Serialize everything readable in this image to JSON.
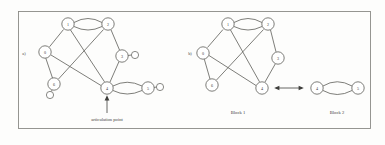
{
  "figure": {
    "panels": [
      {
        "id": "a",
        "label": "a)"
      },
      {
        "id": "b",
        "label": "b)"
      }
    ],
    "annotations": {
      "articulation_point": "articulation point",
      "block_1": "Block 1",
      "block_2": "Block 2"
    },
    "colors": {
      "background": "#fdfdfc",
      "frame_stroke": "#8b8b86",
      "node_stroke": "#5d5d58",
      "node_fill": "#ffffff",
      "edge_stroke": "#5d5d58",
      "text": "#3f3f3c"
    }
  },
  "graph_a": {
    "description": "Undirected graph with an articulation point at vertex 4",
    "nodes": [
      {
        "id": "1",
        "label": "1",
        "cx": 68,
        "cy": 24,
        "r": 6.2
      },
      {
        "id": "2",
        "label": "2",
        "cx": 108,
        "cy": 24,
        "r": 6.2
      },
      {
        "id": "3",
        "label": "3",
        "cx": 122,
        "cy": 56,
        "r": 6.2
      },
      {
        "id": "4",
        "label": "4",
        "cx": 107,
        "cy": 88,
        "r": 6.2
      },
      {
        "id": "5",
        "label": "5",
        "cx": 148,
        "cy": 88,
        "r": 6.2
      },
      {
        "id": "6",
        "label": "6",
        "cx": 54,
        "cy": 84,
        "r": 6.2
      },
      {
        "id": "0",
        "label": "0",
        "cx": 45,
        "cy": 52,
        "r": 6.2
      }
    ],
    "pendant_nodes": [
      {
        "id": "p3",
        "attached_to": "3",
        "cx": 135,
        "cy": 55,
        "r": 3.6
      },
      {
        "id": "p5",
        "attached_to": "5",
        "cx": 160,
        "cy": 87,
        "r": 3.6
      },
      {
        "id": "p6",
        "attached_to": "6",
        "cx": 50,
        "cy": 95,
        "r": 3.6
      }
    ],
    "edges": [
      {
        "from": "1",
        "to": "2",
        "style": "double"
      },
      {
        "from": "1",
        "to": "0",
        "style": "line"
      },
      {
        "from": "1",
        "to": "4",
        "style": "line"
      },
      {
        "from": "2",
        "to": "6",
        "style": "line"
      },
      {
        "from": "2",
        "to": "3",
        "style": "line"
      },
      {
        "from": "3",
        "to": "4",
        "style": "line"
      },
      {
        "from": "0",
        "to": "6",
        "style": "line"
      },
      {
        "from": "0",
        "to": "4",
        "style": "line"
      },
      {
        "from": "4",
        "to": "5",
        "style": "double"
      }
    ],
    "articulation_vertex": "4"
  },
  "graph_b": {
    "description": "Same graph split into two biconnected blocks about the articulation point",
    "block_1": {
      "name": "Block 1",
      "nodes": [
        {
          "id": "1",
          "label": "1",
          "cx": 228,
          "cy": 24,
          "r": 6.2
        },
        {
          "id": "2",
          "label": "2",
          "cx": 268,
          "cy": 24,
          "r": 6.2
        },
        {
          "id": "3",
          "label": "3",
          "cx": 278,
          "cy": 58,
          "r": 6.2
        },
        {
          "id": "4",
          "label": "4",
          "cx": 262,
          "cy": 88,
          "r": 6.2
        },
        {
          "id": "6",
          "label": "6",
          "cx": 212,
          "cy": 85,
          "r": 6.2
        },
        {
          "id": "0",
          "label": "0",
          "cx": 203,
          "cy": 53,
          "r": 6.2
        }
      ],
      "edges": [
        {
          "from": "1",
          "to": "2",
          "style": "double"
        },
        {
          "from": "1",
          "to": "0",
          "style": "line"
        },
        {
          "from": "1",
          "to": "4",
          "style": "line"
        },
        {
          "from": "2",
          "to": "6",
          "style": "line"
        },
        {
          "from": "2",
          "to": "3",
          "style": "line"
        },
        {
          "from": "3",
          "to": "4",
          "style": "line"
        },
        {
          "from": "0",
          "to": "6",
          "style": "line"
        },
        {
          "from": "0",
          "to": "4",
          "style": "line"
        }
      ]
    },
    "block_2": {
      "name": "Block 2",
      "nodes": [
        {
          "id": "4",
          "label": "4",
          "cx": 317,
          "cy": 88,
          "r": 6.2
        },
        {
          "id": "5",
          "label": "5",
          "cx": 358,
          "cy": 88,
          "r": 6.2
        }
      ],
      "edges": [
        {
          "from": "4",
          "to": "5",
          "style": "double"
        }
      ]
    },
    "separator_arrow": {
      "from_x": 275,
      "to_x": 303,
      "y": 88,
      "double_headed": true
    }
  }
}
